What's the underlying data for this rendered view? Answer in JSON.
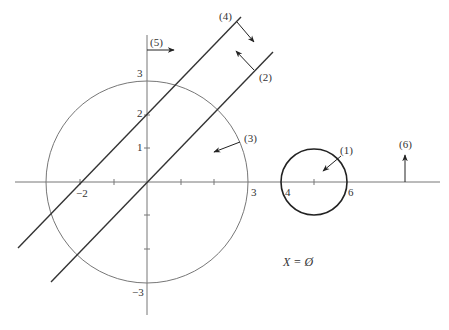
{
  "diagram": {
    "colors": {
      "axis": "#777777",
      "big_circle": "#777777",
      "small_circle": "#222222",
      "lines": "#333333",
      "arrows": "#222222",
      "text": "#333333"
    },
    "axes": {
      "x_ticks": [
        {
          "value": -2,
          "label": "−2"
        },
        {
          "value": 3,
          "label": "3"
        },
        {
          "value": 4,
          "label": "4"
        },
        {
          "value": 6,
          "label": "6"
        }
      ],
      "y_ticks": [
        {
          "value": 3,
          "label": "3"
        },
        {
          "value": 2,
          "label": "2"
        },
        {
          "value": 1,
          "label": "1"
        },
        {
          "value": -3,
          "label": "−3"
        }
      ]
    },
    "constraints": [
      {
        "id": "(1)",
        "label": "(1)",
        "shape": "circle centered (5,0) radius 1",
        "arrow": "inward"
      },
      {
        "id": "(2)",
        "label": "(2)",
        "shape": "line y = x",
        "arrow": "up-left"
      },
      {
        "id": "(3)",
        "label": "(3)",
        "shape": "circle centered (0,0) radius 3",
        "arrow": "inward"
      },
      {
        "id": "(4)",
        "label": "(4)",
        "shape": "line y = x + 2",
        "arrow": "down-right"
      },
      {
        "id": "(5)",
        "label": "(5)",
        "shape": "vertical line x = 0",
        "arrow": "right"
      },
      {
        "id": "(6)",
        "label": "(6)",
        "shape": "x-axis y = 0",
        "arrow": "up"
      }
    ],
    "caption": "X = Ø"
  }
}
